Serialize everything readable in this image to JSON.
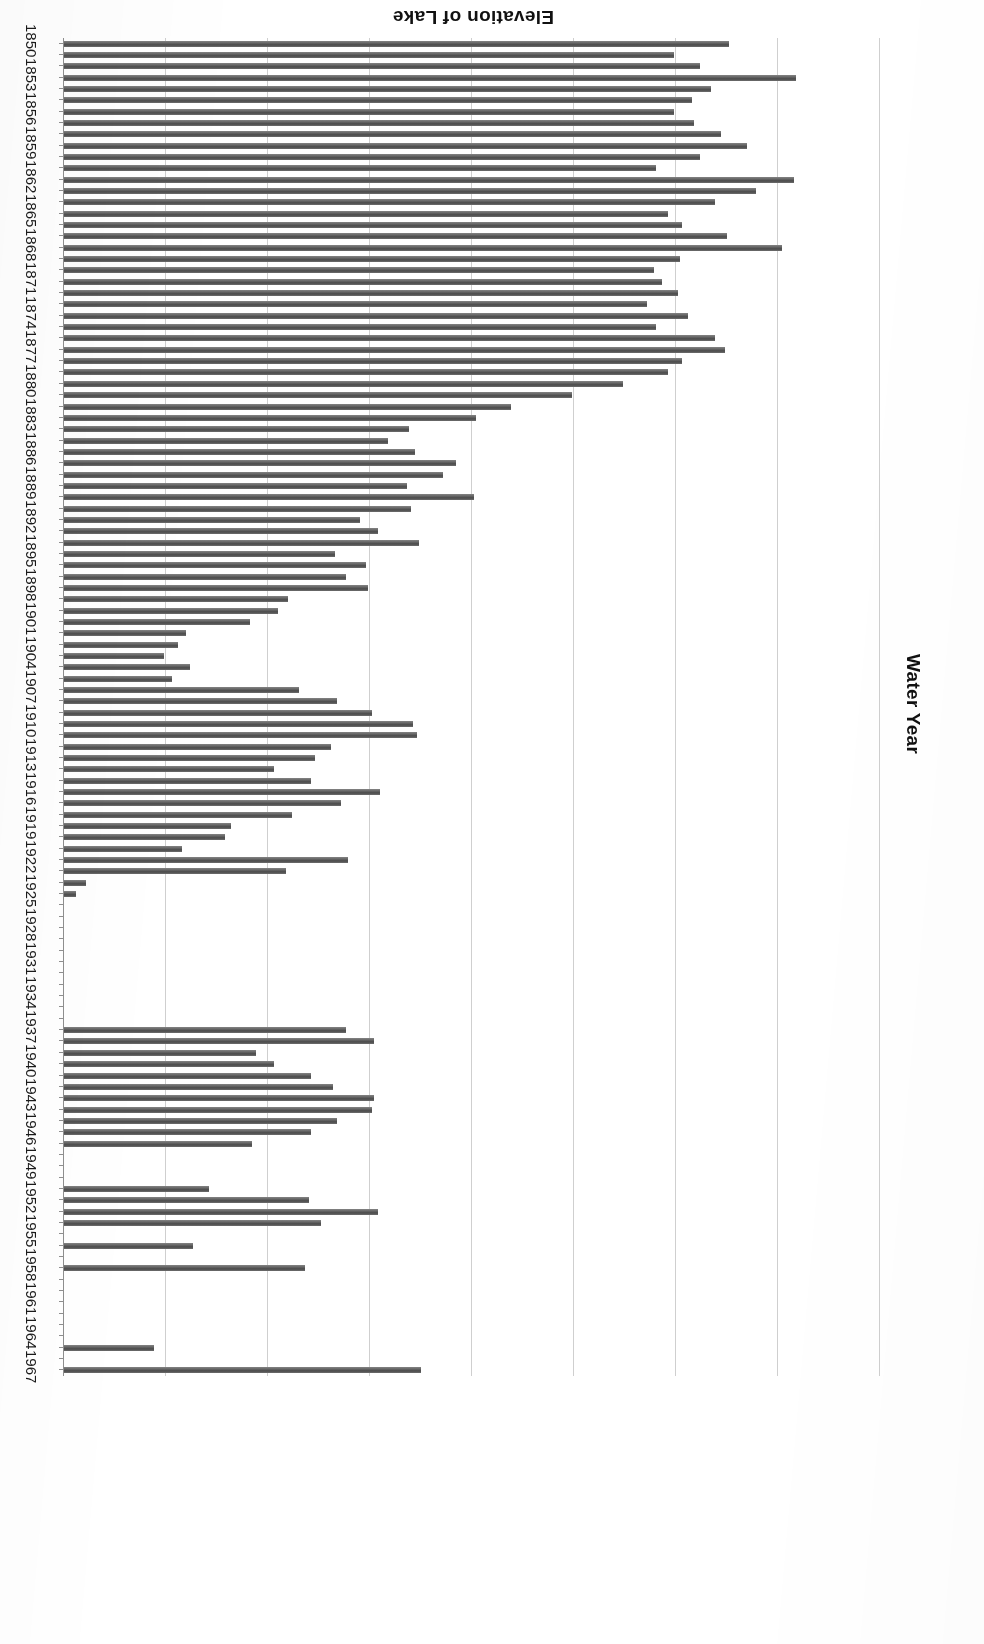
{
  "chart_data": {
    "type": "bar",
    "orientation": "horizontal",
    "title": "",
    "xlabel": "Elevation of Lake",
    "ylabel": "Water Year",
    "xlim": [
      179.0,
      219.0
    ],
    "x_reversed": true,
    "grid": true,
    "legend": null,
    "xticks": [
      "219.0",
      "214.0",
      "209.0",
      "204.0",
      "199.0",
      "194.0",
      "189.0",
      "184.0",
      "179.0"
    ],
    "xtick_values": [
      219.0,
      214.0,
      209.0,
      204.0,
      199.0,
      194.0,
      189.0,
      184.0,
      179.0
    ],
    "ytick_labels": [
      "1850",
      "1853",
      "1856",
      "1859",
      "1862",
      "1865",
      "1868",
      "1871",
      "1874",
      "1877",
      "1880",
      "1883",
      "1886",
      "1889",
      "1892",
      "1895",
      "1898",
      "1901",
      "1904",
      "1907",
      "1910",
      "1913",
      "1916",
      "1919",
      "1922",
      "1925",
      "1928",
      "1931",
      "1934",
      "1937",
      "1940",
      "1943",
      "1946",
      "1949",
      "1952",
      "1955",
      "1958",
      "1961",
      "1964",
      "1967"
    ],
    "bar_color": "#595959",
    "categories": [
      1850,
      1851,
      1852,
      1853,
      1854,
      1855,
      1856,
      1857,
      1858,
      1859,
      1860,
      1861,
      1862,
      1863,
      1864,
      1865,
      1866,
      1867,
      1868,
      1869,
      1870,
      1871,
      1872,
      1873,
      1874,
      1875,
      1876,
      1877,
      1878,
      1879,
      1880,
      1881,
      1882,
      1883,
      1884,
      1885,
      1886,
      1887,
      1888,
      1889,
      1890,
      1891,
      1892,
      1893,
      1894,
      1895,
      1896,
      1897,
      1898,
      1899,
      1900,
      1901,
      1902,
      1903,
      1904,
      1905,
      1906,
      1907,
      1908,
      1909,
      1910,
      1911,
      1912,
      1913,
      1914,
      1915,
      1916,
      1917,
      1918,
      1919,
      1920,
      1921,
      1922,
      1923,
      1924,
      1925,
      1926,
      1927,
      1928,
      1929,
      1930,
      1931,
      1932,
      1933,
      1934,
      1935,
      1936,
      1937,
      1938,
      1939,
      1940,
      1941,
      1942,
      1943,
      1944,
      1945,
      1946,
      1947,
      1948,
      1949,
      1950,
      1951,
      1952,
      1953,
      1954,
      1955,
      1956,
      1957,
      1958,
      1959,
      1960,
      1961,
      1962,
      1963,
      1964,
      1965,
      1966,
      1967
    ],
    "values": [
      211.6,
      208.9,
      210.2,
      214.9,
      210.7,
      209.8,
      208.9,
      209.9,
      211.2,
      212.5,
      210.2,
      208.0,
      214.8,
      212.9,
      210.9,
      208.6,
      209.3,
      211.5,
      214.2,
      209.2,
      207.9,
      208.3,
      209.1,
      207.6,
      209.6,
      208.0,
      210.9,
      211.4,
      209.3,
      208.6,
      206.4,
      203.9,
      200.9,
      199.2,
      195.9,
      194.9,
      196.2,
      198.2,
      197.6,
      195.8,
      199.1,
      196.0,
      193.5,
      194.4,
      196.4,
      192.3,
      193.8,
      192.8,
      193.9,
      190.0,
      189.5,
      188.1,
      185.0,
      184.6,
      183.9,
      185.2,
      184.3,
      190.5,
      192.4,
      194.1,
      196.1,
      196.3,
      192.1,
      191.3,
      189.3,
      191.1,
      194.5,
      192.6,
      190.2,
      187.2,
      186.9,
      184.8,
      192.9,
      189.9,
      180.1,
      179.6,
      179.0,
      179.0,
      179.0,
      179.0,
      179.0,
      179.0,
      179.0,
      179.0,
      179.0,
      179.0,
      179.0,
      192.8,
      194.2,
      188.4,
      189.3,
      191.1,
      192.2,
      194.2,
      194.1,
      192.4,
      191.1,
      188.2,
      179.0,
      179.0,
      179.0,
      186.1,
      191.0,
      194.4,
      191.6,
      179.0,
      185.3,
      179.0,
      190.8,
      179.0,
      179.0,
      179.0,
      179.0,
      179.0,
      179.0,
      183.4,
      179.0,
      196.5
    ]
  },
  "axis": {
    "value_title": "Elevation of Lake",
    "category_title": "Water Year"
  }
}
